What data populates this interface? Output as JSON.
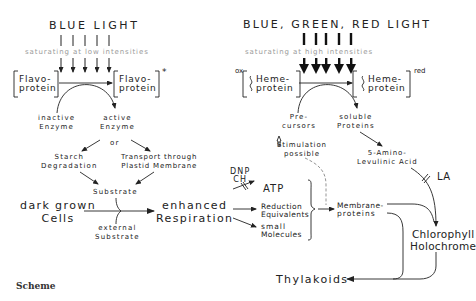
{
  "left": {
    "title": "BLUE LIGHT",
    "saturation": "saturating at low intensities",
    "protein_left": [
      "Flavo-",
      "protein"
    ],
    "protein_right": [
      "Flavo-",
      "protein"
    ],
    "protein_right_mark": "*",
    "inactive": [
      "inactive",
      "Enzyme"
    ],
    "active": [
      "active",
      "Enzyme"
    ],
    "or": "or",
    "starch": [
      "Starch",
      "Degradation"
    ],
    "transport": [
      "Transport through",
      "Plastid Membrane"
    ],
    "substrate": "Substrate",
    "dark_cells": [
      "dark grown",
      "Cells"
    ],
    "external": [
      "external",
      "Substrate"
    ],
    "respiration": [
      "enhanced",
      "Respiration"
    ]
  },
  "right": {
    "title": "BLUE, GREEN, RED LIGHT",
    "saturation": "saturating at high intensities",
    "ox": "ox",
    "red": "red",
    "heme_left": [
      "Heme-",
      "protein"
    ],
    "heme_right": [
      "Heme-",
      "protein"
    ],
    "precursors": [
      "Pre-",
      "cursors"
    ],
    "soluble": [
      "soluble",
      "Proteins"
    ],
    "stimulation": [
      "Stimulation",
      "possible"
    ],
    "ala": [
      "5-Amino-",
      "Levulinic Acid"
    ],
    "la": "LA",
    "dnp": [
      "DNP",
      "CH"
    ],
    "atp": "ATP",
    "reduction": [
      "Reduction",
      "Equivalents"
    ],
    "small_mol": [
      "small",
      "Molecules"
    ],
    "membrane": [
      "Membrane-",
      "proteins"
    ],
    "chlorophyll": [
      "Chlorophyll",
      "Holochrome"
    ],
    "thylakoids": "Thylakoids"
  },
  "caption": "Scheme"
}
